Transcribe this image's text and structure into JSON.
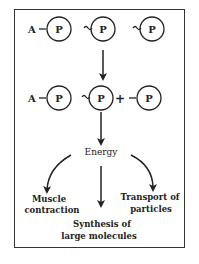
{
  "diagram": {
    "row1": {
      "adenosine": "A",
      "phosphates": [
        "P",
        "P",
        "P"
      ],
      "bond_symbols": [
        "—",
        "~",
        "~"
      ]
    },
    "row2": {
      "adenosine": "A",
      "phosphates": [
        "P",
        "P",
        "P"
      ],
      "plus": "+"
    },
    "energy_label": "Energy",
    "uses": [
      {
        "line1": "Muscle",
        "line2": "contraction"
      },
      {
        "line1": "Synthesis of",
        "line2": "large molecules"
      },
      {
        "line1": "Transport of",
        "line2": "particles"
      }
    ],
    "colors": {
      "ink": "#222222",
      "background": "#ffffff"
    }
  }
}
